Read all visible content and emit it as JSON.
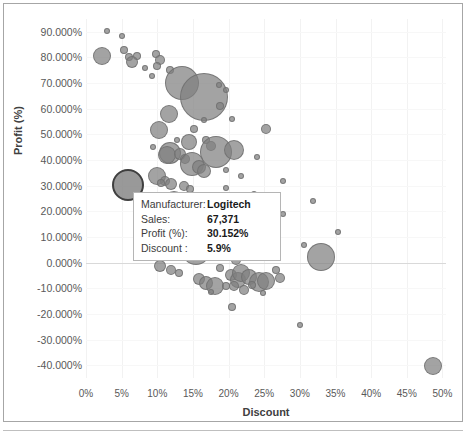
{
  "chart_data": {
    "type": "scatter",
    "title": "",
    "xlabel": "Discount",
    "ylabel": "Profit (%)",
    "xlim": [
      0,
      0.505
    ],
    "ylim": [
      -0.45,
      0.95
    ],
    "grid": true,
    "legend": "none",
    "x_tick_labels": [
      "0%",
      "5%",
      "10%",
      "15%",
      "20%",
      "25%",
      "30%",
      "35%",
      "40%",
      "45%",
      "50%"
    ],
    "x_tick_values": [
      0,
      0.05,
      0.1,
      0.15,
      0.2,
      0.25,
      0.3,
      0.35,
      0.4,
      0.45,
      0.5
    ],
    "y_tick_labels": [
      "90.000%",
      "80.000%",
      "70.000%",
      "60.000%",
      "50.000%",
      "40.000%",
      "30.000%",
      "20.000%",
      "10.000%",
      "0.000%",
      "-10.000%",
      "-20.000%",
      "-30.000%",
      "-40.000%"
    ],
    "y_tick_values": [
      0.9,
      0.8,
      0.7,
      0.6,
      0.5,
      0.4,
      0.3,
      0.2,
      0.1,
      0.0,
      -0.1,
      -0.2,
      -0.3,
      -0.4
    ],
    "bubble_color": "#808080",
    "highlight_border_color": "#3f3f3f",
    "size_encoding": "Sales",
    "points": [
      {
        "x": 0.03,
        "y": 0.905,
        "s": 3
      },
      {
        "x": 0.05,
        "y": 0.885,
        "s": 3
      },
      {
        "x": 0.023,
        "y": 0.805,
        "s": 9
      },
      {
        "x": 0.053,
        "y": 0.828,
        "s": 4
      },
      {
        "x": 0.06,
        "y": 0.8,
        "s": 4
      },
      {
        "x": 0.072,
        "y": 0.805,
        "s": 4
      },
      {
        "x": 0.064,
        "y": 0.782,
        "s": 6
      },
      {
        "x": 0.098,
        "y": 0.812,
        "s": 4
      },
      {
        "x": 0.104,
        "y": 0.79,
        "s": 5
      },
      {
        "x": 0.1,
        "y": 0.768,
        "s": 4
      },
      {
        "x": 0.083,
        "y": 0.758,
        "s": 3
      },
      {
        "x": 0.118,
        "y": 0.752,
        "s": 4
      },
      {
        "x": 0.093,
        "y": 0.728,
        "s": 3
      },
      {
        "x": 0.134,
        "y": 0.7,
        "s": 17
      },
      {
        "x": 0.166,
        "y": 0.644,
        "s": 24
      },
      {
        "x": 0.186,
        "y": 0.693,
        "s": 3
      },
      {
        "x": 0.196,
        "y": 0.673,
        "s": 3
      },
      {
        "x": 0.188,
        "y": 0.612,
        "s": 4
      },
      {
        "x": 0.116,
        "y": 0.578,
        "s": 9
      },
      {
        "x": 0.103,
        "y": 0.518,
        "s": 9
      },
      {
        "x": 0.152,
        "y": 0.522,
        "s": 4
      },
      {
        "x": 0.253,
        "y": 0.52,
        "s": 5
      },
      {
        "x": 0.145,
        "y": 0.47,
        "s": 8
      },
      {
        "x": 0.168,
        "y": 0.478,
        "s": 4
      },
      {
        "x": 0.176,
        "y": 0.455,
        "s": 5
      },
      {
        "x": 0.182,
        "y": 0.432,
        "s": 16
      },
      {
        "x": 0.208,
        "y": 0.438,
        "s": 10
      },
      {
        "x": 0.118,
        "y": 0.426,
        "s": 11
      },
      {
        "x": 0.113,
        "y": 0.418,
        "s": 9
      },
      {
        "x": 0.132,
        "y": 0.422,
        "s": 6
      },
      {
        "x": 0.139,
        "y": 0.404,
        "s": 5
      },
      {
        "x": 0.148,
        "y": 0.385,
        "s": 12
      },
      {
        "x": 0.158,
        "y": 0.372,
        "s": 7
      },
      {
        "x": 0.166,
        "y": 0.356,
        "s": 7
      },
      {
        "x": 0.099,
        "y": 0.338,
        "s": 9
      },
      {
        "x": 0.111,
        "y": 0.318,
        "s": 5
      },
      {
        "x": 0.105,
        "y": 0.312,
        "s": 4
      },
      {
        "x": 0.119,
        "y": 0.306,
        "s": 6
      },
      {
        "x": 0.059,
        "y": 0.302,
        "s": 16,
        "highlight": true,
        "label": "Logitech"
      },
      {
        "x": 0.137,
        "y": 0.3,
        "s": 5
      },
      {
        "x": 0.146,
        "y": 0.288,
        "s": 4
      },
      {
        "x": 0.196,
        "y": 0.292,
        "s": 3
      },
      {
        "x": 0.112,
        "y": 0.258,
        "s": 4
      },
      {
        "x": 0.123,
        "y": 0.242,
        "s": 10
      },
      {
        "x": 0.104,
        "y": 0.222,
        "s": 4
      },
      {
        "x": 0.133,
        "y": 0.2,
        "s": 3
      },
      {
        "x": 0.141,
        "y": 0.182,
        "s": 6
      },
      {
        "x": 0.15,
        "y": 0.176,
        "s": 7
      },
      {
        "x": 0.137,
        "y": 0.136,
        "s": 5
      },
      {
        "x": 0.148,
        "y": 0.13,
        "s": 7
      },
      {
        "x": 0.128,
        "y": 0.118,
        "s": 3
      },
      {
        "x": 0.155,
        "y": 0.046,
        "s": 14
      },
      {
        "x": 0.329,
        "y": 0.02,
        "s": 14
      },
      {
        "x": 0.104,
        "y": -0.012,
        "s": 6
      },
      {
        "x": 0.119,
        "y": -0.03,
        "s": 5
      },
      {
        "x": 0.131,
        "y": -0.04,
        "s": 4
      },
      {
        "x": 0.188,
        "y": -0.022,
        "s": 4
      },
      {
        "x": 0.204,
        "y": -0.048,
        "s": 6
      },
      {
        "x": 0.213,
        "y": -0.066,
        "s": 8
      },
      {
        "x": 0.218,
        "y": -0.04,
        "s": 9
      },
      {
        "x": 0.229,
        "y": -0.058,
        "s": 8
      },
      {
        "x": 0.243,
        "y": -0.074,
        "s": 10
      },
      {
        "x": 0.252,
        "y": -0.07,
        "s": 9
      },
      {
        "x": 0.266,
        "y": -0.03,
        "s": 4
      },
      {
        "x": 0.272,
        "y": -0.06,
        "s": 5
      },
      {
        "x": 0.158,
        "y": -0.062,
        "s": 6
      },
      {
        "x": 0.168,
        "y": -0.08,
        "s": 7
      },
      {
        "x": 0.181,
        "y": -0.092,
        "s": 9
      },
      {
        "x": 0.196,
        "y": -0.092,
        "s": 4
      },
      {
        "x": 0.207,
        "y": -0.09,
        "s": 5
      },
      {
        "x": 0.233,
        "y": -0.086,
        "s": 4
      },
      {
        "x": 0.176,
        "y": -0.116,
        "s": 3
      },
      {
        "x": 0.222,
        "y": -0.108,
        "s": 5
      },
      {
        "x": 0.248,
        "y": -0.118,
        "s": 3
      },
      {
        "x": 0.205,
        "y": -0.172,
        "s": 4
      },
      {
        "x": 0.3,
        "y": -0.242,
        "s": 3
      },
      {
        "x": 0.487,
        "y": -0.402,
        "s": 9
      },
      {
        "x": 0.354,
        "y": 0.118,
        "s": 3
      },
      {
        "x": 0.306,
        "y": 0.07,
        "s": 3
      },
      {
        "x": 0.318,
        "y": 0.242,
        "s": 3
      },
      {
        "x": 0.276,
        "y": 0.318,
        "s": 3
      },
      {
        "x": 0.236,
        "y": 0.268,
        "s": 3
      },
      {
        "x": 0.276,
        "y": 0.188,
        "s": 3
      },
      {
        "x": 0.092,
        "y": 0.178,
        "s": 3
      },
      {
        "x": 0.086,
        "y": 0.148,
        "s": 3
      },
      {
        "x": 0.095,
        "y": 0.088,
        "s": 4
      },
      {
        "x": 0.118,
        "y": 0.09,
        "s": 5
      },
      {
        "x": 0.109,
        "y": 0.068,
        "s": 4
      },
      {
        "x": 0.21,
        "y": 0.012,
        "s": 5
      },
      {
        "x": 0.158,
        "y": 0.216,
        "s": 3
      },
      {
        "x": 0.217,
        "y": 0.338,
        "s": 3
      },
      {
        "x": 0.196,
        "y": 0.36,
        "s": 3
      },
      {
        "x": 0.128,
        "y": 0.48,
        "s": 3
      },
      {
        "x": 0.094,
        "y": 0.452,
        "s": 3
      },
      {
        "x": 0.24,
        "y": 0.412,
        "s": 3
      },
      {
        "x": 0.165,
        "y": 0.558,
        "s": 3
      },
      {
        "x": 0.205,
        "y": 0.56,
        "s": 3
      }
    ]
  },
  "tooltip": {
    "rows": [
      {
        "key": "Manufacturer:",
        "value": "Logitech"
      },
      {
        "key": "Sales:",
        "value": "67,371"
      },
      {
        "key": "Profit (%):",
        "value": "30.152%"
      },
      {
        "key": "Discount :",
        "value": "5.9%"
      }
    ]
  }
}
